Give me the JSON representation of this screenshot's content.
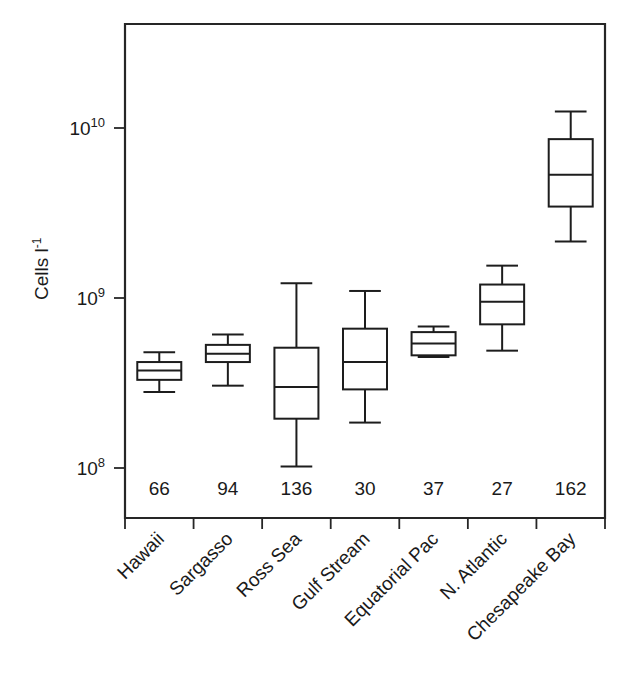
{
  "chart_data": {
    "type": "box",
    "title": "",
    "xlabel": "",
    "ylabel": "Cells l",
    "ylabel_exponent": "-1",
    "yscale": "log",
    "ylim": [
      50000000,
      40000000000
    ],
    "grid": false,
    "legend": "none",
    "ytick_labels": [
      {
        "base": "10",
        "exp": "10",
        "value": 10000000000
      },
      {
        "base": "10",
        "exp": "9",
        "value": 1000000000
      },
      {
        "base": "10",
        "exp": "8",
        "value": 100000000
      }
    ],
    "categories": [
      "Hawaii",
      "Sargasso",
      "Ross Sea",
      "Gulf Stream",
      "Equatorial Pac",
      "N. Atlantic",
      "Chesapeake Bay"
    ],
    "counts": [
      66,
      94,
      136,
      30,
      37,
      27,
      162
    ],
    "count_row_label": "n",
    "boxes": [
      {
        "category": "Hawaii",
        "n": 66,
        "whisker_low": 280000000.0,
        "q1": 330000000.0,
        "median": 375000000.0,
        "q3": 420000000.0,
        "whisker_high": 480000000.0
      },
      {
        "category": "Sargasso",
        "n": 94,
        "whisker_low": 305000000.0,
        "q1": 420000000.0,
        "median": 470000000.0,
        "q3": 530000000.0,
        "whisker_high": 610000000.0
      },
      {
        "category": "Ross Sea",
        "n": 136,
        "whisker_low": 102000000.0,
        "q1": 195000000.0,
        "median": 300000000.0,
        "q3": 510000000.0,
        "whisker_high": 1220000000.0
      },
      {
        "category": "Gulf Stream",
        "n": 30,
        "whisker_low": 185000000.0,
        "q1": 290000000.0,
        "median": 420000000.0,
        "q3": 660000000.0,
        "whisker_high": 1100000000.0
      },
      {
        "category": "Equatorial Pac",
        "n": 37,
        "whisker_low": 450000000.0,
        "q1": 460000000.0,
        "median": 540000000.0,
        "q3": 630000000.0,
        "whisker_high": 680000000.0
      },
      {
        "category": "N. Atlantic",
        "n": 27,
        "whisker_low": 490000000.0,
        "q1": 700000000.0,
        "median": 950000000.0,
        "q3": 1200000000.0,
        "whisker_high": 1550000000.0
      },
      {
        "category": "Chesapeake Bay",
        "n": 162,
        "whisker_low": 2150000000.0,
        "q1": 3450000000.0,
        "median": 5300000000.0,
        "q3": 8600000000.0,
        "whisker_high": 12500000000.0
      }
    ]
  },
  "figure": {
    "plot_left": 125,
    "plot_right": 605,
    "plot_top": 24,
    "plot_bottom": 518
  }
}
